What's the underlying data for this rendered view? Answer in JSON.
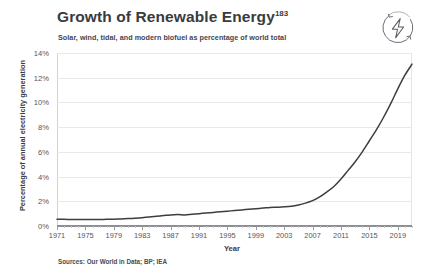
{
  "header": {
    "title": "Growth of Renewable Energy",
    "title_superscript": "183",
    "subtitle": "Solar, wind, tidal, and modern biofuel as percentage of world total",
    "logo_name": "renewable-energy-logo"
  },
  "footer": {
    "sources": "Sources: Our World in Data; BP; IEA"
  },
  "colors": {
    "line": "#3d3d44",
    "grid": "#e9e9ec",
    "axis": "#8e8e95",
    "text": "#3c3c42",
    "tick_text": "#55555c",
    "background": "#ffffff"
  },
  "chart_data": {
    "type": "line",
    "title": "Growth of Renewable Energy",
    "subtitle": "Solar, wind, tidal, and modern biofuel as percentage of world total",
    "xlabel": "Year",
    "ylabel": "Percentage of annual electricity generation",
    "xlim": [
      1971,
      2021
    ],
    "ylim": [
      0,
      14
    ],
    "ytick_labels": [
      "0%",
      "2%",
      "4%",
      "6%",
      "8%",
      "10%",
      "12%",
      "14%"
    ],
    "ytick_values": [
      0,
      2,
      4,
      6,
      8,
      10,
      12,
      14
    ],
    "xtick_labels": [
      "1971",
      "1975",
      "1979",
      "1983",
      "1987",
      "1991",
      "1995",
      "1999",
      "2003",
      "2007",
      "2011",
      "2015",
      "2019"
    ],
    "xtick_values": [
      1971,
      1975,
      1979,
      1983,
      1987,
      1991,
      1995,
      1999,
      2003,
      2007,
      2011,
      2015,
      2019
    ],
    "grid": "horizontal",
    "legend": "none",
    "series": [
      {
        "name": "Renewables share of electricity generation",
        "x": [
          1971,
          1972,
          1973,
          1974,
          1975,
          1976,
          1977,
          1978,
          1979,
          1980,
          1981,
          1982,
          1983,
          1984,
          1985,
          1986,
          1987,
          1988,
          1989,
          1990,
          1991,
          1992,
          1993,
          1994,
          1995,
          1996,
          1997,
          1998,
          1999,
          2000,
          2001,
          2002,
          2003,
          2004,
          2005,
          2006,
          2007,
          2008,
          2009,
          2010,
          2011,
          2012,
          2013,
          2014,
          2015,
          2016,
          2017,
          2018,
          2019,
          2020,
          2021
        ],
        "values": [
          0.55,
          0.54,
          0.53,
          0.52,
          0.52,
          0.52,
          0.53,
          0.54,
          0.55,
          0.57,
          0.6,
          0.63,
          0.67,
          0.72,
          0.78,
          0.84,
          0.9,
          0.93,
          0.9,
          0.95,
          1.0,
          1.05,
          1.1,
          1.15,
          1.2,
          1.25,
          1.3,
          1.35,
          1.4,
          1.45,
          1.5,
          1.52,
          1.55,
          1.6,
          1.7,
          1.85,
          2.05,
          2.35,
          2.75,
          3.2,
          3.8,
          4.5,
          5.2,
          6.0,
          6.9,
          7.8,
          8.8,
          9.9,
          11.1,
          12.2,
          13.1
        ],
        "color": "#3d3d44",
        "endpoint_value": 13.1,
        "start_value": 0.55
      }
    ]
  }
}
